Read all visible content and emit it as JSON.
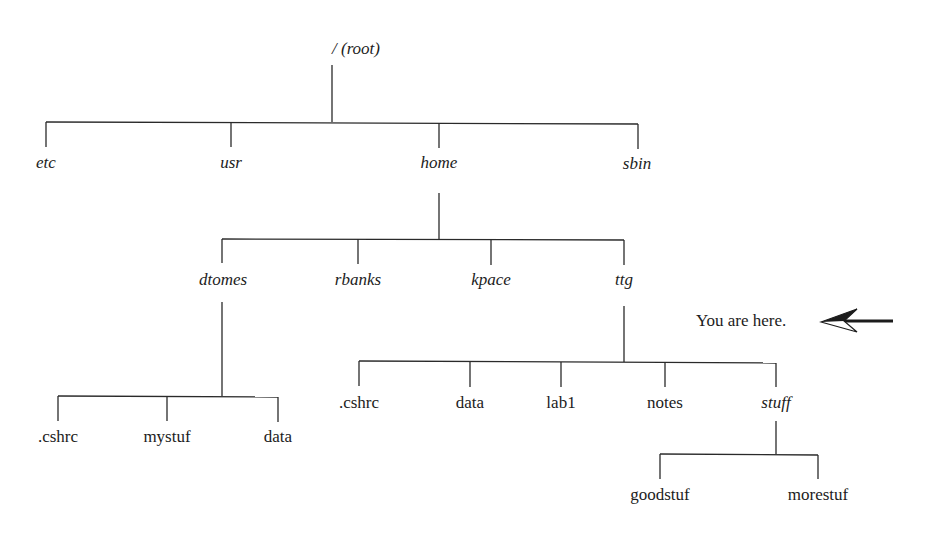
{
  "diagram": {
    "type": "directory-tree",
    "root": {
      "label": "/ (root)"
    },
    "level1": [
      {
        "label": "etc",
        "kind": "directory"
      },
      {
        "label": "usr",
        "kind": "directory"
      },
      {
        "label": "home",
        "kind": "directory"
      },
      {
        "label": "sbin",
        "kind": "directory"
      }
    ],
    "home_children": [
      {
        "label": "dtomes",
        "kind": "directory"
      },
      {
        "label": "rbanks",
        "kind": "directory"
      },
      {
        "label": "kpace",
        "kind": "directory"
      },
      {
        "label": "ttg",
        "kind": "directory"
      }
    ],
    "dtomes_children": [
      {
        "label": ".cshrc",
        "kind": "file"
      },
      {
        "label": "mystuf",
        "kind": "file"
      },
      {
        "label": "data",
        "kind": "file"
      }
    ],
    "ttg_children": [
      {
        "label": ".cshrc",
        "kind": "file"
      },
      {
        "label": "data",
        "kind": "file"
      },
      {
        "label": "lab1",
        "kind": "file"
      },
      {
        "label": "notes",
        "kind": "file"
      },
      {
        "label": "stuff",
        "kind": "directory"
      }
    ],
    "stuff_children": [
      {
        "label": "goodstuf",
        "kind": "file"
      },
      {
        "label": "morestuf",
        "kind": "file"
      }
    ],
    "annotation": {
      "text": "You are here.",
      "points_to": "ttg",
      "icon": "left-arrow-icon"
    }
  }
}
